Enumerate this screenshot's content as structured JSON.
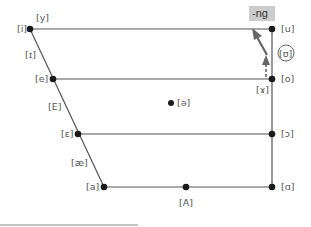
{
  "diagram": {
    "type": "vowel-quadrilateral",
    "colors": {
      "line": "#555555",
      "dot": "#1a1a1a",
      "label": "#555555",
      "highlight": "#cccccc",
      "arrow": "#666666"
    },
    "vowels": {
      "i": "[i]",
      "y": "[y]",
      "small_cap_i": "[ɪ]",
      "e": "[e]",
      "E": "[E]",
      "epsilon": "[ɛ]",
      "ae": "[æ]",
      "a": "[a]",
      "A": "[A]",
      "alpha": "[ɑ]",
      "open_o": "[ɔ]",
      "o": "[o]",
      "ram_horn": "[ɤ]",
      "u": "[u]",
      "upsilon": "[ʊ]",
      "schwa": "[ə]"
    },
    "annotation": {
      "ng_label": "-ng"
    }
  }
}
